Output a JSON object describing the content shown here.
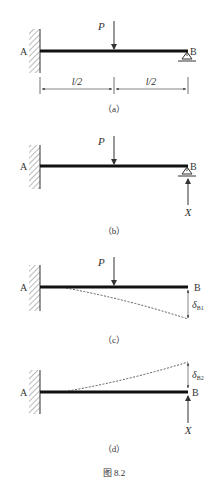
{
  "figure": {
    "caption": "图 8.2",
    "caption_glyph": "图",
    "caption_number": "8.2",
    "panels": [
      {
        "id": "a",
        "label": "（a）",
        "point_a": "A",
        "point_b": "B",
        "load": "P",
        "dim_left": "l/2",
        "dim_right": "l/2",
        "support_b": "pin-roller"
      },
      {
        "id": "b",
        "label": "（b）",
        "point_a": "A",
        "point_b": "B",
        "load": "P",
        "reaction": "X",
        "support_b": "pin-roller"
      },
      {
        "id": "c",
        "label": "（c）",
        "point_a": "A",
        "point_b": "B",
        "load": "P",
        "deflection": "δ",
        "deflection_sub": "B1"
      },
      {
        "id": "d",
        "label": "（d）",
        "point_a": "A",
        "point_b": "B",
        "reaction": "X",
        "deflection": "δ",
        "deflection_sub": "B2"
      }
    ]
  },
  "colors": {
    "beam": "#111111",
    "line": "#333333",
    "text": "#333333",
    "hatch": "#555555"
  }
}
